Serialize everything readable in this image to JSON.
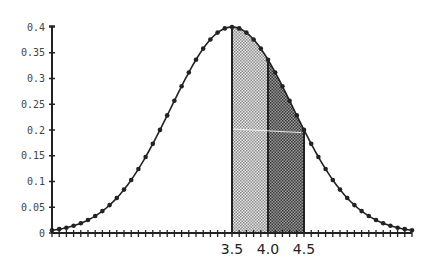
{
  "chart_data": {
    "type": "area",
    "title": "",
    "xlabel": "",
    "ylabel": "",
    "ylim": [
      0,
      0.4
    ],
    "xlim": [
      1.0,
      6.0
    ],
    "grid": false,
    "legend": null,
    "y_ticks": [
      0,
      0.05,
      0.1,
      0.15,
      0.2,
      0.25,
      0.3,
      0.35,
      0.4
    ],
    "y_tick_labels": [
      "0",
      "0.05",
      "0.1",
      "0.15",
      "0.2",
      "0.25",
      "0.3",
      "0.35",
      "0.4"
    ],
    "x_tick_step": 0.1,
    "x_labels": [
      {
        "value": 3.5,
        "label": "3.5"
      },
      {
        "value": 4.0,
        "label": "4.0"
      },
      {
        "value": 4.5,
        "label": "4.5"
      }
    ],
    "curve": {
      "mean": 3.5,
      "sigma": 0.85,
      "peak": 0.4,
      "x_start": 1.0,
      "x_end": 6.0,
      "step": 0.1,
      "marker": "dot"
    },
    "shaded_regions": [
      {
        "from": 3.5,
        "to": 4.0,
        "shade": "light",
        "pattern_color": "#9a9a9a"
      },
      {
        "from": 4.0,
        "to": 4.5,
        "shade": "dark",
        "pattern_color": "#555555"
      }
    ],
    "series": [
      {
        "name": "density",
        "x": [
          1.0,
          1.1,
          1.2,
          1.3,
          1.4,
          1.5,
          1.6,
          1.7,
          1.8,
          1.9,
          2.0,
          2.1,
          2.2,
          2.3,
          2.4,
          2.5,
          2.6,
          2.7,
          2.8,
          2.9,
          3.0,
          3.1,
          3.2,
          3.3,
          3.4,
          3.5,
          3.6,
          3.7,
          3.8,
          3.9,
          4.0,
          4.1,
          4.2,
          4.3,
          4.4,
          4.5,
          4.6,
          4.7,
          4.8,
          4.9,
          5.0,
          5.1,
          5.2,
          5.3,
          5.4,
          5.5,
          5.6,
          5.7,
          5.8,
          5.9,
          6.0
        ],
        "values": [
          0.005,
          0.006,
          0.009,
          0.013,
          0.019,
          0.025,
          0.033,
          0.043,
          0.054,
          0.068,
          0.084,
          0.101,
          0.12,
          0.14,
          0.162,
          0.184,
          0.227,
          0.255,
          0.285,
          0.314,
          0.336,
          0.355,
          0.37,
          0.385,
          0.395,
          0.4,
          0.395,
          0.385,
          0.37,
          0.355,
          0.336,
          0.314,
          0.285,
          0.255,
          0.227,
          0.2,
          0.17,
          0.143,
          0.118,
          0.095,
          0.075,
          0.058,
          0.044,
          0.032,
          0.023,
          0.016,
          0.011,
          0.008,
          0.006,
          0.004,
          0.003
        ]
      }
    ],
    "colors": {
      "curve": "#222222",
      "axis": "#222222",
      "light_fill": "#c8c8c8",
      "dark_fill": "#8a8a8a",
      "background": "#ffffff"
    }
  }
}
